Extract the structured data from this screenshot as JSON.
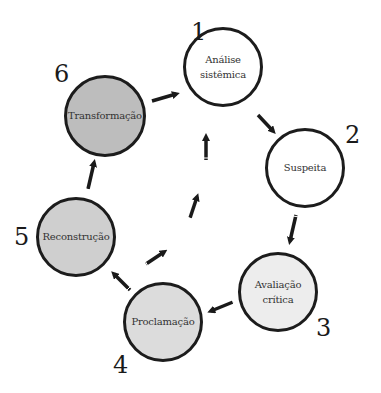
{
  "diagram": {
    "type": "cycle",
    "colors": {
      "stroke": "#1c1c1c",
      "arrow": "#1a1a1a",
      "fill_1": "#ffffff",
      "fill_2": "#ffffff",
      "fill_3": "#ededed",
      "fill_4": "#dcdcdc",
      "fill_5": "#cfcfcf",
      "fill_6": "#bdbdbd"
    },
    "nodes": [
      {
        "number": "1",
        "line1": "Análise",
        "line2": "sistêmica"
      },
      {
        "number": "2",
        "line1": "Suspeita",
        "line2": ""
      },
      {
        "number": "3",
        "line1": "Avaliação",
        "line2": "crítica"
      },
      {
        "number": "4",
        "line1": "Proclamação",
        "line2": ""
      },
      {
        "number": "5",
        "line1": "Reconstrução",
        "line2": ""
      },
      {
        "number": "6",
        "line1": "Transformação",
        "line2": ""
      }
    ],
    "edges": [
      {
        "from": "1",
        "to": "2"
      },
      {
        "from": "2",
        "to": "3"
      },
      {
        "from": "3",
        "to": "4"
      },
      {
        "from": "4",
        "to": "5"
      },
      {
        "from": "5",
        "to": "6"
      },
      {
        "from": "6",
        "to": "1"
      },
      {
        "from": "center",
        "to": "1",
        "style": "dashed-arrows"
      }
    ]
  }
}
